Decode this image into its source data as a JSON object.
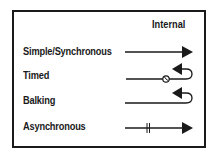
{
  "legend": {
    "column_header": "Internal",
    "rows": [
      {
        "label": "Simple/Synchronous",
        "symbol": "solid-arrow"
      },
      {
        "label": "Timed",
        "symbol": "clock-line-curl-back-arrow"
      },
      {
        "label": "Balking",
        "symbol": "line-curl-back-arrow"
      },
      {
        "label": "Asynchronous",
        "symbol": "double-tick-arrow"
      }
    ]
  },
  "colors": {
    "ink": "#1a1a1a",
    "background": "#ffffff"
  }
}
